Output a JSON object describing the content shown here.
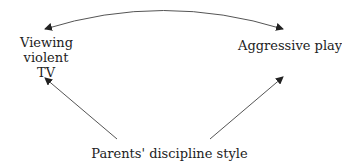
{
  "diagram": {
    "nodes": {
      "viewing_tv": {
        "line1": "Viewing",
        "line2": "violent TV"
      },
      "aggressive_play": {
        "label": "Aggressive play"
      },
      "discipline": {
        "label": "Parents' discipline style"
      }
    },
    "edges": [
      {
        "from": "viewing_tv",
        "to": "aggressive_play",
        "type": "bidirectional-curved"
      },
      {
        "from": "discipline",
        "to": "viewing_tv",
        "type": "directed"
      },
      {
        "from": "discipline",
        "to": "aggressive_play",
        "type": "directed"
      }
    ],
    "colors": {
      "line": "#555555",
      "text": "#222222",
      "background": "#ffffff"
    }
  }
}
